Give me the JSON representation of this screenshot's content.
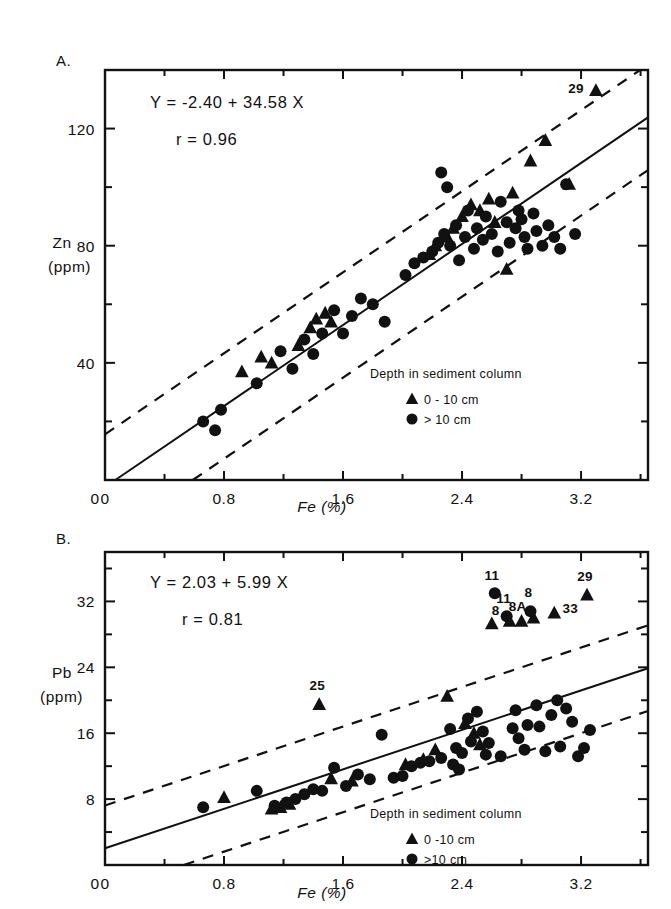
{
  "figure": {
    "background": "#ffffff",
    "ink": "#111111"
  },
  "panels": [
    {
      "letter": "A.",
      "equation": "Y = -2.40 + 34.58 X",
      "correlation": "r = 0.96",
      "ylabel_line1": "Zn",
      "ylabel_line2": "(ppm)",
      "xlabel": "Fe (%)",
      "legend_title": "Depth in sediment column",
      "legend_triangle": "0 - 10 cm",
      "legend_circle": "> 10 cm",
      "outlier_labels": [
        "29"
      ]
    },
    {
      "letter": "B.",
      "equation": "Y = 2.03 + 5.99 X",
      "correlation": "r = 0.81",
      "ylabel_line1": "Pb",
      "ylabel_line2": "(ppm)",
      "xlabel": "Fe (%)",
      "legend_title": "Depth in sediment column",
      "legend_triangle": "0 -10 cm",
      "legend_circle": ">10 cm",
      "outlier_labels": [
        "11",
        "11",
        "8",
        "8",
        "8A",
        "33",
        "29",
        "25"
      ]
    }
  ],
  "chart_data": [
    {
      "type": "scatter",
      "panel": "A",
      "title": "",
      "xlabel": "Fe (%)",
      "ylabel": "Zn (ppm)",
      "xlim": [
        0,
        3.65
      ],
      "ylim": [
        0,
        140
      ],
      "xticks": [
        0,
        0.8,
        1.6,
        2.4,
        3.2
      ],
      "xticklabels": [
        "0",
        "0.8",
        "1.6",
        "2.4",
        "3.2"
      ],
      "xminorticks": [
        0.4,
        1.2,
        2.0,
        2.8,
        3.6
      ],
      "yticks": [
        0,
        40,
        80,
        120
      ],
      "yticklabels": [
        "0",
        "40",
        "80",
        "120"
      ],
      "yminorticks": [
        20,
        60,
        100,
        140
      ],
      "grid": false,
      "legend_position": "lower-right",
      "regression": {
        "intercept": -2.4,
        "slope": 34.58,
        "r": 0.96
      },
      "confidence_band_offset": 18,
      "series": [
        {
          "name": "0 - 10 cm",
          "marker": "triangle",
          "points": [
            [
              0.92,
              37
            ],
            [
              1.05,
              42
            ],
            [
              1.12,
              40
            ],
            [
              1.3,
              46
            ],
            [
              1.38,
              52
            ],
            [
              1.42,
              55
            ],
            [
              1.48,
              57
            ],
            [
              1.52,
              54
            ],
            [
              2.18,
              77
            ],
            [
              2.22,
              80
            ],
            [
              2.3,
              83
            ],
            [
              2.34,
              86
            ],
            [
              2.4,
              90
            ],
            [
              2.46,
              94
            ],
            [
              2.52,
              92
            ],
            [
              2.58,
              96
            ],
            [
              2.62,
              88
            ],
            [
              2.7,
              72
            ],
            [
              2.74,
              98
            ],
            [
              2.86,
              109
            ],
            [
              2.96,
              116
            ],
            [
              3.12,
              101
            ],
            [
              3.3,
              133
            ]
          ]
        },
        {
          "name": "> 10 cm",
          "marker": "circle",
          "points": [
            [
              0.66,
              20
            ],
            [
              0.74,
              17
            ],
            [
              0.78,
              24
            ],
            [
              1.02,
              33
            ],
            [
              1.18,
              44
            ],
            [
              1.26,
              38
            ],
            [
              1.34,
              48
            ],
            [
              1.4,
              43
            ],
            [
              1.46,
              50
            ],
            [
              1.54,
              58
            ],
            [
              1.6,
              50
            ],
            [
              1.66,
              56
            ],
            [
              1.72,
              62
            ],
            [
              1.8,
              60
            ],
            [
              1.88,
              54
            ],
            [
              2.02,
              70
            ],
            [
              2.08,
              74
            ],
            [
              2.14,
              76
            ],
            [
              2.2,
              78
            ],
            [
              2.24,
              81
            ],
            [
              2.28,
              84
            ],
            [
              2.32,
              80
            ],
            [
              2.36,
              87
            ],
            [
              2.38,
              75
            ],
            [
              2.42,
              83
            ],
            [
              2.44,
              92
            ],
            [
              2.48,
              79
            ],
            [
              2.5,
              86
            ],
            [
              2.54,
              82
            ],
            [
              2.56,
              90
            ],
            [
              2.6,
              84
            ],
            [
              2.64,
              78
            ],
            [
              2.66,
              95
            ],
            [
              2.7,
              88
            ],
            [
              2.72,
              81
            ],
            [
              2.76,
              86
            ],
            [
              2.78,
              92
            ],
            [
              2.8,
              89
            ],
            [
              2.82,
              83
            ],
            [
              2.84,
              79
            ],
            [
              2.88,
              91
            ],
            [
              2.9,
              85
            ],
            [
              2.94,
              80
            ],
            [
              2.98,
              87
            ],
            [
              3.02,
              83
            ],
            [
              3.06,
              79
            ],
            [
              3.1,
              101
            ],
            [
              3.16,
              84
            ],
            [
              2.26,
              105
            ],
            [
              2.3,
              100
            ]
          ]
        }
      ],
      "annotations": [
        {
          "label": "29",
          "x": 3.3,
          "y": 133
        }
      ]
    },
    {
      "type": "scatter",
      "panel": "B",
      "title": "",
      "xlabel": "Fe (%)",
      "ylabel": "Pb (ppm)",
      "xlim": [
        0,
        3.65
      ],
      "ylim": [
        0,
        38
      ],
      "xticks": [
        0,
        0.8,
        1.6,
        2.4,
        3.2
      ],
      "xticklabels": [
        "0",
        "0.8",
        "1.6",
        "2.4",
        "3.2"
      ],
      "xminorticks": [
        0.4,
        1.2,
        2.0,
        2.8,
        3.6
      ],
      "yticks": [
        8,
        16,
        24,
        32
      ],
      "yticklabels": [
        "8",
        "16",
        "24",
        "32"
      ],
      "yminorticks": [
        4,
        12,
        20,
        28,
        36
      ],
      "grid": false,
      "legend_position": "lower-right",
      "regression": {
        "intercept": 2.03,
        "slope": 5.99,
        "r": 0.81
      },
      "confidence_band_offset": 5.2,
      "series": [
        {
          "name": "0 -10 cm",
          "marker": "triangle",
          "points": [
            [
              0.8,
              8.2
            ],
            [
              1.12,
              6.8
            ],
            [
              1.18,
              7.0
            ],
            [
              1.24,
              7.4
            ],
            [
              1.44,
              19.5
            ],
            [
              1.52,
              10.5
            ],
            [
              1.66,
              10.2
            ],
            [
              2.02,
              12.2
            ],
            [
              2.22,
              14.0
            ],
            [
              2.3,
              20.5
            ],
            [
              2.42,
              17.2
            ],
            [
              2.48,
              16.0
            ],
            [
              2.52,
              14.6
            ],
            [
              2.6,
              29.3
            ],
            [
              2.72,
              29.6
            ],
            [
              2.8,
              29.6
            ],
            [
              2.88,
              30.0
            ],
            [
              3.02,
              30.6
            ],
            [
              3.24,
              32.8
            ],
            [
              2.14,
              12.8
            ]
          ]
        },
        {
          "name": ">10 cm",
          "marker": "circle",
          "points": [
            [
              0.66,
              7.0
            ],
            [
              1.02,
              9.0
            ],
            [
              1.14,
              7.2
            ],
            [
              1.22,
              7.6
            ],
            [
              1.28,
              8.0
            ],
            [
              1.34,
              8.6
            ],
            [
              1.4,
              9.2
            ],
            [
              1.46,
              9.0
            ],
            [
              1.54,
              11.8
            ],
            [
              1.62,
              9.6
            ],
            [
              1.7,
              11.0
            ],
            [
              1.78,
              10.4
            ],
            [
              1.86,
              15.8
            ],
            [
              1.94,
              10.6
            ],
            [
              2.0,
              10.8
            ],
            [
              2.06,
              12.0
            ],
            [
              2.12,
              12.4
            ],
            [
              2.18,
              12.6
            ],
            [
              2.26,
              13.0
            ],
            [
              2.32,
              16.5
            ],
            [
              2.36,
              14.2
            ],
            [
              2.4,
              13.6
            ],
            [
              2.44,
              17.8
            ],
            [
              2.46,
              15.0
            ],
            [
              2.5,
              18.6
            ],
            [
              2.54,
              16.2
            ],
            [
              2.56,
              13.4
            ],
            [
              2.58,
              14.8
            ],
            [
              2.62,
              33.0
            ],
            [
              2.66,
              13.2
            ],
            [
              2.7,
              30.2
            ],
            [
              2.74,
              16.6
            ],
            [
              2.76,
              18.8
            ],
            [
              2.78,
              15.4
            ],
            [
              2.82,
              14.0
            ],
            [
              2.84,
              17.0
            ],
            [
              2.86,
              30.8
            ],
            [
              2.9,
              19.4
            ],
            [
              2.92,
              16.8
            ],
            [
              2.96,
              13.8
            ],
            [
              3.0,
              18.2
            ],
            [
              3.04,
              20.0
            ],
            [
              3.06,
              14.4
            ],
            [
              3.1,
              19.0
            ],
            [
              3.14,
              17.4
            ],
            [
              3.18,
              13.2
            ],
            [
              3.22,
              14.2
            ],
            [
              3.26,
              16.4
            ],
            [
              2.34,
              12.2
            ],
            [
              2.38,
              11.6
            ]
          ]
        }
      ],
      "annotations": [
        {
          "label": "11",
          "x": 2.62,
          "y": 33.0
        },
        {
          "label": "11",
          "x": 2.7,
          "y": 30.2
        },
        {
          "label": "8",
          "x": 2.86,
          "y": 30.8
        },
        {
          "label": "8",
          "x": 2.72,
          "y": 29.6
        },
        {
          "label": "8A",
          "x": 2.8,
          "y": 29.6
        },
        {
          "label": "33",
          "x": 3.02,
          "y": 30.6
        },
        {
          "label": "29",
          "x": 3.24,
          "y": 32.8
        },
        {
          "label": "25",
          "x": 1.44,
          "y": 19.5
        }
      ]
    }
  ]
}
